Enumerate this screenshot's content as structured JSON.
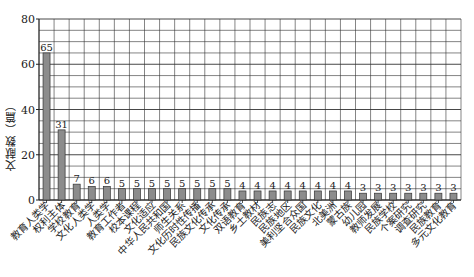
{
  "chart_data": {
    "type": "bar",
    "title": "",
    "xlabel": "",
    "ylabel": "文献数（篇）",
    "ylim": [
      0,
      80
    ],
    "yticks": [
      0,
      20,
      40,
      60,
      80
    ],
    "grid": true,
    "legend": null,
    "categories": [
      "教育人类学",
      "权利主体",
      "学校教育",
      "文化人类学",
      "人类学",
      "教育工作者",
      "校本课程",
      "文化适应",
      "中华人民共和国",
      "师生关系",
      "文化历时性传播",
      "民族文化传承",
      "文化传承",
      "双语教育",
      "乡土教材",
      "民族志",
      "民族地区",
      "美利坚合众国",
      "民族文化",
      "北美洲",
      "蒙古族",
      "幼儿园",
      "教师发展",
      "民族学校",
      "个案研究",
      "调查研究",
      "民族教育",
      "多元文化教育"
    ],
    "values": [
      65,
      31,
      7,
      6,
      6,
      5,
      5,
      5,
      5,
      5,
      5,
      5,
      5,
      4,
      4,
      4,
      4,
      4,
      4,
      4,
      4,
      3,
      3,
      3,
      3,
      3,
      3,
      3
    ],
    "colors": {
      "bar": "#8c8c8c",
      "bar_border": "#333333",
      "grid": "#333333"
    }
  }
}
